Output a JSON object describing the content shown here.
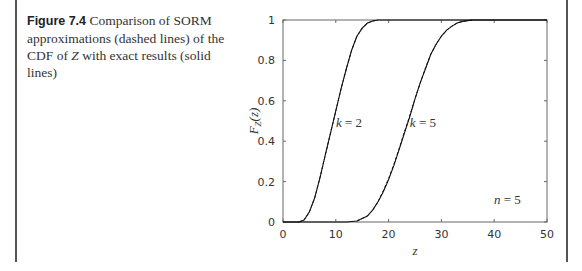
{
  "caption": {
    "label": "Figure 7.4",
    "text_before_var": " Comparison of SORM approximations (dashed lines) of the CDF of ",
    "var": "Z",
    "text_after_var": " with exact results (solid lines)"
  },
  "chart_data": {
    "type": "line",
    "title": "",
    "xlabel": "z",
    "ylabel": "F_Z(z)",
    "xlim": [
      0,
      50
    ],
    "ylim": [
      0,
      1
    ],
    "xticks": [
      0,
      10,
      20,
      30,
      40,
      50
    ],
    "yticks": [
      0,
      0.2,
      0.4,
      0.6,
      0.8,
      1
    ],
    "xtick_labels": [
      "0",
      "10",
      "20",
      "30",
      "40",
      "50"
    ],
    "ytick_labels": [
      "0",
      "0.2",
      "0.4",
      "0.6",
      "0.8",
      "1"
    ],
    "grid": false,
    "annotations": [
      {
        "text": "k = 2",
        "x": 12.5,
        "y": 0.47
      },
      {
        "text": "k = 5",
        "x": 26.5,
        "y": 0.47
      },
      {
        "text": "n = 5",
        "x": 42.5,
        "y": 0.09
      }
    ],
    "series": [
      {
        "name": "k = 2 exact (solid)",
        "style": "solid",
        "x": [
          0,
          3,
          4,
          5,
          6,
          7,
          8,
          9,
          10,
          11,
          12,
          13,
          14,
          15,
          16,
          17,
          18,
          20,
          50
        ],
        "y": [
          0,
          0,
          0.01,
          0.05,
          0.12,
          0.22,
          0.33,
          0.44,
          0.55,
          0.66,
          0.76,
          0.85,
          0.92,
          0.96,
          0.985,
          0.995,
          1,
          1,
          1
        ]
      },
      {
        "name": "k = 2 SORM (dashed)",
        "style": "dashed",
        "x": [
          3,
          4,
          5,
          6,
          7,
          8,
          9,
          10,
          11,
          12,
          13,
          14,
          15,
          16,
          17,
          18
        ],
        "y": [
          0,
          0.01,
          0.05,
          0.12,
          0.22,
          0.33,
          0.44,
          0.55,
          0.66,
          0.76,
          0.85,
          0.92,
          0.96,
          0.985,
          0.995,
          1
        ]
      },
      {
        "name": "k = 5 exact (solid)",
        "style": "solid",
        "x": [
          0,
          12,
          14,
          16,
          17,
          18,
          19,
          20,
          21,
          22,
          23,
          24,
          25,
          26,
          27,
          28,
          29,
          30,
          31,
          32,
          33,
          34,
          35,
          36,
          38,
          50
        ],
        "y": [
          0,
          0,
          0.005,
          0.03,
          0.06,
          0.1,
          0.15,
          0.21,
          0.28,
          0.36,
          0.44,
          0.52,
          0.61,
          0.69,
          0.76,
          0.83,
          0.88,
          0.92,
          0.95,
          0.97,
          0.985,
          0.993,
          0.997,
          1,
          1,
          1
        ]
      },
      {
        "name": "k = 5 SORM (dashed)",
        "style": "dashed",
        "x": [
          14,
          16,
          17,
          18,
          19,
          20,
          21,
          22,
          23,
          24,
          25,
          26,
          27,
          28,
          29,
          30,
          31,
          32,
          33,
          34,
          35,
          36
        ],
        "y": [
          0.005,
          0.03,
          0.06,
          0.1,
          0.155,
          0.215,
          0.285,
          0.365,
          0.445,
          0.525,
          0.61,
          0.69,
          0.765,
          0.83,
          0.88,
          0.92,
          0.95,
          0.97,
          0.985,
          0.993,
          0.997,
          1
        ]
      }
    ]
  }
}
